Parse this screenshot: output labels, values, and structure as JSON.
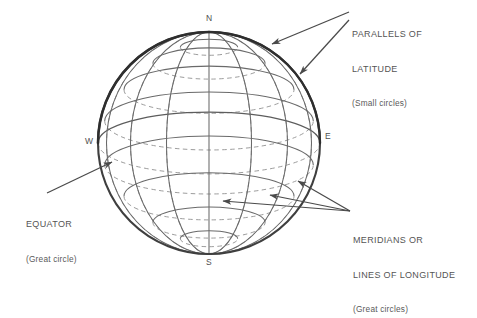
{
  "figure": {
    "type": "wireframe-sphere",
    "background": "#ffffff",
    "line_color": "#5a5a5a",
    "outline_color": "#3f3f3f",
    "sphere": {
      "center_x": 209,
      "center_y": 143,
      "radius": 111
    },
    "parallels_latitudes_deg": [
      75,
      60,
      40,
      20,
      0,
      -20,
      -40,
      -60,
      -75
    ],
    "meridians_longitudes_deg": [
      -90,
      -67.5,
      -45,
      -22.5,
      0,
      22.5,
      45,
      67.5,
      90
    ],
    "equator_latitude_deg": 0,
    "front_line_style": "solid",
    "back_line_style": "dashed"
  },
  "cardinals": {
    "north": "N",
    "south": "S",
    "west": "W",
    "east": "E"
  },
  "labels": {
    "parallels": {
      "line1": "PARALLELS OF",
      "line2": "LATITUDE",
      "note": "(Small circles)"
    },
    "meridians": {
      "line1": "MERIDIANS OR",
      "line2": "LINES OF LONGITUDE",
      "note": "(Great circles)"
    },
    "equator": {
      "line1": "EQUATOR",
      "note": "(Great circle)"
    }
  },
  "leaders": {
    "parallels_arrows": 2,
    "meridians_arrows": 3,
    "equator_arrows": 1
  }
}
